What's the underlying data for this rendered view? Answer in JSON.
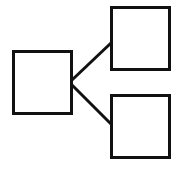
{
  "diagram": {
    "type": "tree",
    "background": "#ffffff",
    "stroke_color": "#111111",
    "nodes": [
      {
        "id": "root",
        "label": "",
        "x": 13,
        "y": 51,
        "w": 59,
        "h": 63
      },
      {
        "id": "child-top",
        "label": "",
        "x": 111,
        "y": 7,
        "w": 59,
        "h": 63
      },
      {
        "id": "child-bottom",
        "label": "",
        "x": 111,
        "y": 95,
        "w": 59,
        "h": 63
      }
    ],
    "edges": [
      {
        "from": "root",
        "to": "child-top"
      },
      {
        "from": "root",
        "to": "child-bottom"
      }
    ]
  }
}
